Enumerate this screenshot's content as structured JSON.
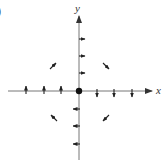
{
  "figure": {
    "panel_label": "(b)",
    "panel_label_visible": ")",
    "x_axis_label": "x",
    "y_axis_label": "y",
    "origin_marker": "filled dot",
    "colors": {
      "axis": "#555555",
      "arrow": "#222222",
      "background": "#ffffff"
    },
    "vectors": [
      {
        "position": "positive y-axis",
        "points": [
          [
            0,
            1
          ],
          [
            0,
            2
          ],
          [
            0,
            3
          ]
        ],
        "direction": "right"
      },
      {
        "position": "negative y-axis",
        "points": [
          [
            0,
            -1
          ],
          [
            0,
            -2
          ],
          [
            0,
            -3
          ]
        ],
        "direction": "left"
      },
      {
        "position": "negative x-axis",
        "points": [
          [
            -1,
            0
          ],
          [
            -2,
            0
          ],
          [
            -3,
            0
          ]
        ],
        "direction": "up"
      },
      {
        "position": "positive x-axis",
        "points": [
          [
            1,
            0
          ],
          [
            2,
            0
          ],
          [
            3,
            0
          ]
        ],
        "direction": "down"
      },
      {
        "position": "quadrant II",
        "point": [
          -1.5,
          1.5
        ],
        "direction": "up-right"
      },
      {
        "position": "quadrant I",
        "point": [
          1.5,
          1.5
        ],
        "direction": "down-right"
      },
      {
        "position": "quadrant III",
        "point": [
          -1.5,
          -1.5
        ],
        "direction": "up-left"
      },
      {
        "position": "quadrant IV",
        "point": [
          1.5,
          -1.5
        ],
        "direction": "down-left"
      }
    ]
  }
}
